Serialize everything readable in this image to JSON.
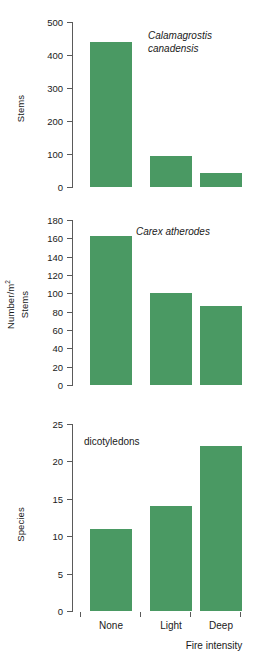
{
  "figure": {
    "panels": [
      {
        "id": "top",
        "annotation": "Calamagrostis\ncanadensis",
        "annotation_style": "italic",
        "ylabel_inner": "Stems",
        "ylabel_outer": null
      },
      {
        "id": "middle",
        "annotation": "Carex atherodes",
        "annotation_style": "italic",
        "ylabel_inner": "Stems",
        "ylabel_outer": "Number/m",
        "ylabel_outer_sup": "2"
      },
      {
        "id": "bottom",
        "annotation": "dicotyledons",
        "annotation_style": "normal",
        "ylabel_inner": "Species",
        "ylabel_outer": null
      }
    ],
    "xaxis_title": "Fire intensity",
    "bar_color": "#4a9963",
    "axis_color": "#5a5a5a"
  },
  "chart_data": [
    {
      "type": "bar",
      "id": "calamagrostis-canadensis",
      "title": "Calamagrostis canadensis",
      "categories": [
        "None",
        "Light",
        "Deep"
      ],
      "values": [
        438,
        95,
        43
      ],
      "xlabel": "Fire intensity",
      "ylabel": "Stems",
      "ylim": [
        0,
        500
      ],
      "yticks": [
        0,
        100,
        200,
        300,
        400,
        500
      ],
      "grid": false,
      "legend": null
    },
    {
      "type": "bar",
      "id": "carex-atherodes",
      "title": "Carex atherodes",
      "categories": [
        "None",
        "Light",
        "Deep"
      ],
      "values": [
        163,
        100,
        86
      ],
      "xlabel": "Fire intensity",
      "ylabel": "Number/m2  Stems",
      "ylim": [
        0,
        180
      ],
      "yticks": [
        0,
        20,
        40,
        60,
        80,
        100,
        120,
        140,
        160,
        180
      ],
      "grid": false,
      "legend": null
    },
    {
      "type": "bar",
      "id": "dicotyledons",
      "title": "dicotyledons",
      "categories": [
        "None",
        "Light",
        "Deep"
      ],
      "values": [
        11,
        14,
        22
      ],
      "xlabel": "Fire intensity",
      "ylabel": "Species",
      "ylim": [
        0,
        25
      ],
      "yticks": [
        0,
        5,
        10,
        15,
        20,
        25
      ],
      "grid": false,
      "legend": null
    }
  ]
}
